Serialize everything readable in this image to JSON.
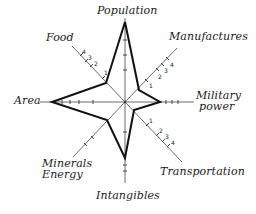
{
  "diagram": {
    "type": "star-profile",
    "center": [
      125,
      102
    ],
    "axes": [
      {
        "id": "population",
        "label": "Population",
        "end": [
          125,
          18
        ],
        "value_point": [
          125,
          22
        ]
      },
      {
        "id": "manufactures",
        "label": "Manufactures",
        "end": [
          176,
          48
        ],
        "value_point": [
          139,
          90
        ],
        "ticks": [
          "1",
          "2",
          "3",
          "4"
        ]
      },
      {
        "id": "military",
        "label": "Military power",
        "label_lines": [
          "Military",
          "power"
        ],
        "end": [
          192,
          102
        ],
        "value_point": [
          160,
          102
        ]
      },
      {
        "id": "transportation",
        "label": "Transportation",
        "end": [
          182,
          162
        ],
        "value_point": [
          134,
          110
        ],
        "ticks": [
          "1",
          "2",
          "3",
          "4"
        ]
      },
      {
        "id": "intangibles",
        "label": "Intangibles",
        "end": [
          125,
          183
        ],
        "value_point": [
          125,
          158
        ]
      },
      {
        "id": "minerals",
        "label": "Minerals Energy",
        "label_lines": [
          "Minerals",
          "Energy"
        ],
        "end": [
          72,
          158
        ],
        "value_point": [
          107,
          120
        ]
      },
      {
        "id": "area",
        "label": "Area",
        "end": [
          42,
          102
        ],
        "value_point": [
          52,
          102
        ]
      },
      {
        "id": "food",
        "label": "Food",
        "end": [
          72,
          46
        ],
        "value_point": [
          106,
          83
        ],
        "ticks": [
          "1",
          "2",
          "3",
          "4"
        ]
      }
    ],
    "labels": {
      "population": "Population",
      "manufactures": "Manufactures",
      "military_1": "Military",
      "military_2": "power",
      "transportation": "Transportation",
      "intangibles": "Intangibles",
      "minerals_1": "Minerals",
      "minerals_2": "Energy",
      "area": "Area",
      "food": "Food"
    },
    "tick_labels": [
      "1",
      "2",
      "3",
      "4"
    ],
    "colors": {
      "axis": "#6b6b6b",
      "profile": "#111111",
      "text": "#1a1a1a",
      "background": "#ffffff"
    }
  }
}
